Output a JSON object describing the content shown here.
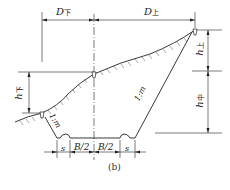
{
  "diagram": {
    "caption": "(b)",
    "labels": {
      "D_lower": {
        "main": "D",
        "sub": "下"
      },
      "D_upper": {
        "main": "D",
        "sub": "上"
      },
      "h_lower": {
        "main": "h",
        "sub": "下"
      },
      "h_upper": {
        "main": "h",
        "sub": "上"
      },
      "h_middle": {
        "main": "h",
        "sub": "中"
      },
      "slope_left": "1:m",
      "slope_right": "1:m",
      "s_left": "s",
      "s_right": "s",
      "half_width_left": "B/2",
      "half_width_right": "B/2"
    },
    "colors": {
      "line": "#222222",
      "hatch": "#555555",
      "background": "#ffffff"
    }
  }
}
